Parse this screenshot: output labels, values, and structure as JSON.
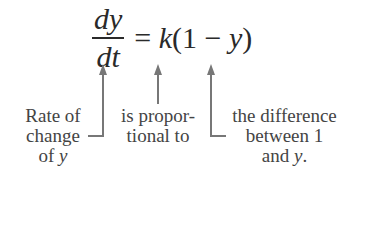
{
  "equation": {
    "numerator": "dy",
    "denominator": "dt",
    "equals": "=",
    "k": "k",
    "open": "(1",
    "minus": "−",
    "y": "y",
    "close": ")"
  },
  "labels": {
    "rate": {
      "line1": "Rate of",
      "line2": "change",
      "line3_prefix": "of ",
      "line3_var": "y"
    },
    "proportional": {
      "line1": "is propor-",
      "line2": "tional to"
    },
    "difference": {
      "line1": "the difference",
      "line2": "between 1",
      "line3_prefix": "and ",
      "line3_var": "y",
      "line3_suffix": "."
    }
  },
  "colors": {
    "arrow": "#777777",
    "text": "#444444"
  }
}
